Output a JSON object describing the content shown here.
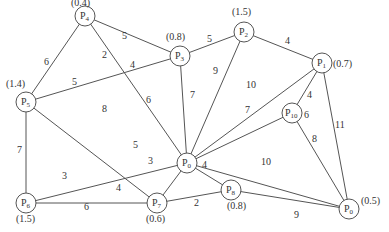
{
  "graph": {
    "nodes": [
      {
        "id": "P0",
        "name": "P",
        "sub": "0",
        "x": 187,
        "y": 163,
        "weight": ""
      },
      {
        "id": "P1",
        "name": "P",
        "sub": "1",
        "x": 322,
        "y": 63,
        "weight": "(0.7)",
        "wx": 333,
        "wy": 67
      },
      {
        "id": "P2",
        "name": "P",
        "sub": "2",
        "x": 244,
        "y": 32,
        "weight": "(1.5)",
        "wx": 232,
        "wy": 15
      },
      {
        "id": "P3",
        "name": "P",
        "sub": "3",
        "x": 180,
        "y": 56,
        "weight": "(0.8)",
        "wx": 166,
        "wy": 40
      },
      {
        "id": "P4",
        "name": "P",
        "sub": "4",
        "x": 85,
        "y": 16,
        "weight": "(0.4)",
        "wx": 71,
        "wy": 6
      },
      {
        "id": "P5",
        "name": "P",
        "sub": "5",
        "x": 26,
        "y": 102,
        "weight": "(1.4)",
        "wx": 6,
        "wy": 87
      },
      {
        "id": "P6",
        "name": "P",
        "sub": "6",
        "x": 26,
        "y": 203,
        "weight": "(1.5)",
        "wx": 16,
        "wy": 222
      },
      {
        "id": "P7",
        "name": "P",
        "sub": "7",
        "x": 157,
        "y": 203,
        "weight": "(0.6)",
        "wx": 146,
        "wy": 222
      },
      {
        "id": "P8",
        "name": "P",
        "sub": "8",
        "x": 231,
        "y": 190,
        "weight": "(0.8)",
        "wx": 227,
        "wy": 209
      },
      {
        "id": "P9",
        "name": "P",
        "sub": "0",
        "x": 349,
        "y": 209,
        "weight": "(0.5)",
        "wx": 361,
        "wy": 204
      },
      {
        "id": "P10",
        "name": "P",
        "sub": "10",
        "x": 292,
        "y": 113,
        "weight": "",
        "wx": 0,
        "wy": 0
      }
    ],
    "edges": [
      {
        "from": "P4",
        "to": "P3",
        "label": "5",
        "lx": 122,
        "ly": 39
      },
      {
        "from": "P4",
        "to": "P5",
        "label": "6",
        "lx": 44,
        "ly": 65
      },
      {
        "from": "P4",
        "to": "P0",
        "label": "6",
        "lx": 146,
        "ly": 103
      },
      {
        "from": "P3",
        "to": "P5",
        "label": "5",
        "lx": 72,
        "ly": 85
      },
      {
        "from": "P3",
        "to": "P2",
        "label": "5",
        "lx": 207,
        "ly": 42
      },
      {
        "from": "P3",
        "to": "P0",
        "label": "7",
        "lx": 190,
        "ly": 98
      },
      {
        "from": "P2",
        "to": "P1",
        "label": "4",
        "lx": 285,
        "ly": 44
      },
      {
        "from": "P2",
        "to": "P0",
        "label": "9",
        "lx": 213,
        "ly": 74
      },
      {
        "from": "P1",
        "to": "P0",
        "label": "10",
        "lx": 246,
        "ly": 88
      },
      {
        "from": "P1",
        "to": "P10",
        "label": "4",
        "lx": 307,
        "ly": 98
      },
      {
        "from": "P1",
        "to": "P9",
        "label": "11",
        "lx": 335,
        "ly": 128
      },
      {
        "from": "P10",
        "to": "P0",
        "label": "7",
        "lx": 245,
        "ly": 113
      },
      {
        "from": "P10",
        "to": "P9",
        "label": "8",
        "lx": 312,
        "ly": 142
      },
      {
        "from": "P5",
        "to": "P6",
        "label": "7",
        "lx": 17,
        "ly": 153
      },
      {
        "from": "P5",
        "to": "P7",
        "label": "8",
        "lx": 102,
        "ly": 112
      },
      {
        "from": "P0",
        "to": "P6",
        "label": "5",
        "lx": 133,
        "ly": 148
      },
      {
        "from": "P0",
        "to": "P7",
        "label": "3",
        "lx": 148,
        "ly": 164
      },
      {
        "from": "P6",
        "to": "P7",
        "label": "6",
        "lx": 84,
        "ly": 210
      },
      {
        "from": "P0",
        "to": "P8",
        "label": "4",
        "lx": 202,
        "ly": 168
      },
      {
        "from": "P0",
        "to": "P9",
        "label": "10",
        "lx": 261,
        "ly": 165
      },
      {
        "from": "P7",
        "to": "P8",
        "label": "2",
        "lx": 194,
        "ly": 206
      },
      {
        "from": "P8",
        "to": "P9",
        "label": "9",
        "lx": 294,
        "ly": 218
      }
    ],
    "extra_labels": [
      {
        "text": "2",
        "x": 102,
        "y": 58
      },
      {
        "text": "4",
        "x": 130,
        "y": 68
      },
      {
        "text": "3",
        "x": 62,
        "y": 179
      },
      {
        "text": "4",
        "x": 116,
        "y": 191
      },
      {
        "text": "6",
        "x": 304,
        "y": 118
      }
    ]
  }
}
